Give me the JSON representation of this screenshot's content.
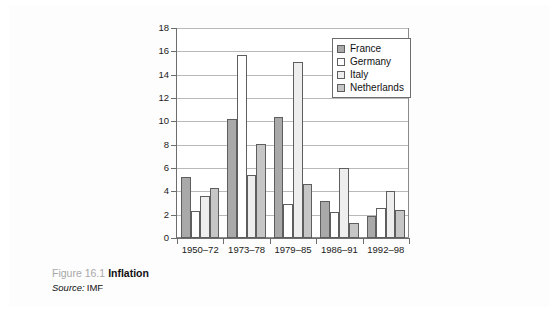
{
  "caption": {
    "figure_number": "Figure 16.1",
    "title": "Inflation",
    "source_label": "Source:",
    "source_value": "IMF"
  },
  "chart_data": {
    "type": "bar",
    "title": "Inflation",
    "xlabel": "",
    "ylabel": "",
    "ylim": [
      0,
      18
    ],
    "ytick_step": 2,
    "yticks": [
      0,
      2,
      4,
      6,
      8,
      10,
      12,
      14,
      16,
      18
    ],
    "grid": true,
    "legend_position": "top-right",
    "categories": [
      "1950–72",
      "1973–78",
      "1979–85",
      "1986–91",
      "1992–98"
    ],
    "series": [
      {
        "name": "France",
        "color": "#a9a9a9",
        "values": [
          5.2,
          10.2,
          10.4,
          3.2,
          1.9
        ]
      },
      {
        "name": "Germany",
        "color": "#ffffff",
        "values": [
          2.3,
          15.7,
          2.9,
          2.2,
          2.6
        ]
      },
      {
        "name": "Italy",
        "color": "#eeeeee",
        "values": [
          3.6,
          5.4,
          15.1,
          6.0,
          4.0
        ]
      },
      {
        "name": "Netherlands",
        "color": "#c6c6c6",
        "values": [
          4.3,
          8.1,
          4.6,
          1.3,
          2.4
        ]
      }
    ]
  }
}
